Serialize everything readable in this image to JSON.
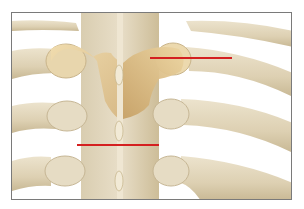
{
  "figure": {
    "colors": {
      "background": "#ffffff",
      "frame_border": "#7a7a7a",
      "bone_light": "#e6dcc4",
      "bone_mid": "#d8c9a8",
      "bone_shadow": "#b8a47e",
      "lamina_highlight": "#e8cf9c",
      "lamina_shadow": "#c9a66a",
      "marker_line": "#d42020"
    },
    "markers": [
      {
        "name": "upper-marker-line",
        "x1": 149,
        "y1": 57,
        "x2": 231,
        "y2": 57
      },
      {
        "name": "lower-marker-line",
        "x1": 76,
        "y1": 144,
        "x2": 158,
        "y2": 144
      }
    ]
  }
}
